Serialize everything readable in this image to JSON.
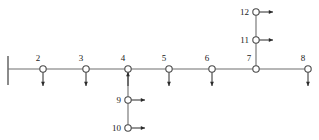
{
  "diagram": {
    "type": "beam-frame-node-diagram",
    "background_color": "#ffffff",
    "line_color": "#6e6e6e",
    "node_stroke_color": "#4a4a4a",
    "node_fill_color": "#ffffff",
    "arrow_color": "#2b2b2b",
    "label_color": "#1a1a1a",
    "support": {
      "name": "fixed-wall-support",
      "x": 8,
      "y_top": 56,
      "y_bottom": 85
    },
    "main_beam": {
      "y": 69,
      "x_start": 8,
      "x_end": 308
    },
    "nodes": [
      {
        "id": "2",
        "label": "2",
        "x": 43,
        "y": 69,
        "label_pos": "above",
        "label_dx": -5,
        "label_dy": -6,
        "arrow": "down"
      },
      {
        "id": "3",
        "label": "3",
        "x": 86,
        "y": 69,
        "label_pos": "above",
        "label_dx": -5,
        "label_dy": -6,
        "arrow": "down"
      },
      {
        "id": "4",
        "label": "4",
        "x": 128,
        "y": 69,
        "label_pos": "above",
        "label_dx": -5,
        "label_dy": -6,
        "arrow": "up"
      },
      {
        "id": "5",
        "label": "5",
        "x": 169,
        "y": 69,
        "label_pos": "above",
        "label_dx": -5,
        "label_dy": -6,
        "arrow": "down"
      },
      {
        "id": "6",
        "label": "6",
        "x": 212,
        "y": 69,
        "label_pos": "above",
        "label_dx": -5,
        "label_dy": -6,
        "arrow": "down"
      },
      {
        "id": "7",
        "label": "7",
        "x": 256,
        "y": 69,
        "label_pos": "above",
        "label_dx": -7,
        "label_dy": -6,
        "arrow": "none"
      },
      {
        "id": "8",
        "label": "8",
        "x": 308,
        "y": 69,
        "label_pos": "above",
        "label_dx": -5,
        "label_dy": -6,
        "arrow": "down"
      },
      {
        "id": "9",
        "label": "9",
        "x": 128,
        "y": 100,
        "label_pos": "left",
        "label_dx": -7,
        "label_dy": 0,
        "arrow": "right"
      },
      {
        "id": "10",
        "label": "10",
        "x": 128,
        "y": 128,
        "label_pos": "left",
        "label_dx": -7,
        "label_dy": 0,
        "arrow": "right"
      },
      {
        "id": "11",
        "label": "11",
        "x": 256,
        "y": 40,
        "label_pos": "left",
        "label_dx": -7,
        "label_dy": 0,
        "arrow": "right"
      },
      {
        "id": "12",
        "label": "12",
        "x": 256,
        "y": 12,
        "label_pos": "left",
        "label_dx": -7,
        "label_dy": 0,
        "arrow": "right"
      }
    ],
    "branches": [
      {
        "name": "lower-branch-from-node-4",
        "x": 128,
        "y_start": 69,
        "y_end": 128
      },
      {
        "name": "upper-branch-from-node-7",
        "x": 256,
        "y_start": 69,
        "y_end": 12
      }
    ],
    "node_radius": 3.2,
    "arrow_length": 14,
    "arrow_offset": 3
  }
}
